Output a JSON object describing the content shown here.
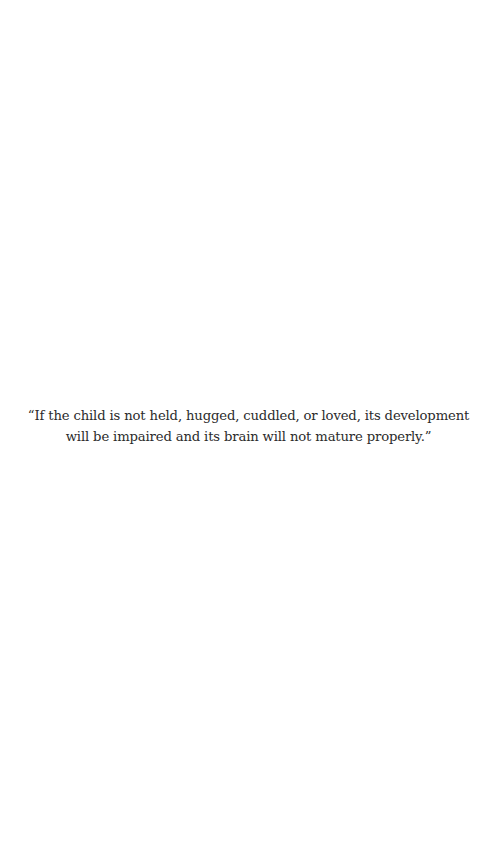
{
  "page": {
    "background": "#ffffff",
    "text_color": "#2b2b2b"
  },
  "quote": {
    "text": "“If the child is not held, hugged, cuddled, or loved, its development will be impaired and its brain will not mature properly.”"
  }
}
